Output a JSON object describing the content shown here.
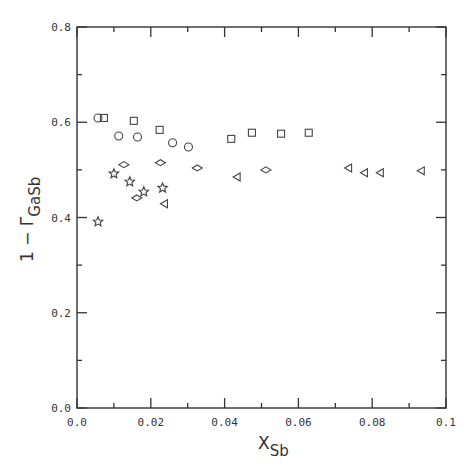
{
  "chart_data": {
    "type": "scatter",
    "title": "",
    "xlabel": "X_Sb",
    "xlabel_main": "X",
    "xlabel_sub": "Sb",
    "ylabel": "1 − Γ_GaSb",
    "ylabel_main": "1 − Γ",
    "ylabel_sub": "GaSb",
    "xlim": [
      0.0,
      0.1
    ],
    "ylim": [
      0.0,
      0.8
    ],
    "x_ticks": [
      0.0,
      0.02,
      0.04,
      0.06,
      0.08,
      0.1
    ],
    "x_tick_labels": [
      "0.0",
      "0.02",
      "0.04",
      "0.06",
      "0.08",
      "0.1"
    ],
    "x_minor_ticks": [
      0.01,
      0.03,
      0.05,
      0.07,
      0.09
    ],
    "y_ticks": [
      0.0,
      0.2,
      0.4,
      0.6,
      0.8
    ],
    "y_tick_labels": [
      "0.0",
      "0.2",
      "0.4",
      "0.6",
      "0.8"
    ],
    "y_minor_ticks": [
      0.1,
      0.3,
      0.5,
      0.7
    ],
    "grid": false,
    "legend": "none",
    "series": [
      {
        "name": "circles",
        "marker": "circle",
        "x": [
          0.0057,
          0.0113,
          0.0164,
          0.0259,
          0.0302
        ],
        "y": [
          0.609,
          0.571,
          0.569,
          0.557,
          0.548
        ]
      },
      {
        "name": "squares",
        "marker": "square",
        "x": [
          0.0073,
          0.0154,
          0.0224,
          0.0418,
          0.0474,
          0.0553,
          0.0628
        ],
        "y": [
          0.609,
          0.603,
          0.584,
          0.565,
          0.578,
          0.576,
          0.578
        ]
      },
      {
        "name": "diamonds",
        "marker": "diamond",
        "x": [
          0.0127,
          0.0162,
          0.0226,
          0.0326,
          0.0512
        ],
        "y": [
          0.511,
          0.441,
          0.515,
          0.504,
          0.5
        ]
      },
      {
        "name": "stars",
        "marker": "star",
        "x": [
          0.0057,
          0.01,
          0.0143,
          0.0181,
          0.0232
        ],
        "y": [
          0.391,
          0.492,
          0.475,
          0.454,
          0.462
        ]
      },
      {
        "name": "triangles",
        "marker": "triangle-left",
        "x": [
          0.0237,
          0.0434,
          0.0736,
          0.0779,
          0.0822,
          0.0933
        ],
        "y": [
          0.429,
          0.485,
          0.504,
          0.494,
          0.494,
          0.498
        ]
      }
    ]
  },
  "layout": {
    "plot_left": 77,
    "plot_right": 446,
    "plot_top": 27,
    "plot_bottom": 408,
    "frame_color": "#333333",
    "marker_color": "#444444"
  }
}
